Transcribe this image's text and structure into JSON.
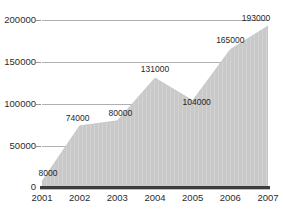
{
  "chart_data": {
    "type": "area",
    "title": "",
    "xlabel": "",
    "ylabel": "",
    "categories": [
      "2001",
      "2002",
      "2003",
      "2004",
      "2005",
      "2006",
      "2007"
    ],
    "values": [
      8000,
      74000,
      80000,
      131000,
      104000,
      165000,
      193000
    ],
    "data_labels": [
      "8000",
      "74000",
      "80000",
      "131000",
      "104000",
      "165000",
      "193000"
    ],
    "ylim": [
      0,
      200000
    ],
    "xlim": [
      "2001",
      "2007"
    ],
    "y_ticks": [
      0,
      50000,
      100000,
      150000,
      200000
    ],
    "y_tick_labels": [
      "0",
      "50000",
      "100000",
      "150000",
      "200000"
    ],
    "grid": "horizontal",
    "legend": "none",
    "colors": {
      "area_fill": "#c9c9c9",
      "gridline": "#b0b0b0",
      "baseline": "#3d3d3d",
      "text": "#2b2b2b"
    }
  }
}
